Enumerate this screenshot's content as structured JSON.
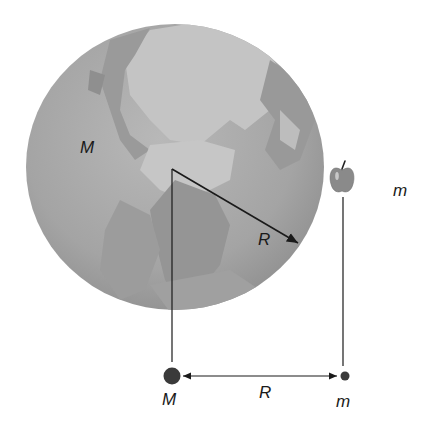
{
  "figure": {
    "colors": {
      "ocean": "#a8a8a8",
      "land": "#8c8c8c",
      "ice": "#c9c9c9",
      "line": "#1a1a1a",
      "apple": "#8a8a8a",
      "background": "#ffffff"
    },
    "globe": {
      "label": "M",
      "radius_label": "R"
    },
    "apple": {
      "label": "m"
    },
    "point_model": {
      "large_mass_label": "M",
      "small_mass_label": "m",
      "separation_label": "R"
    }
  }
}
